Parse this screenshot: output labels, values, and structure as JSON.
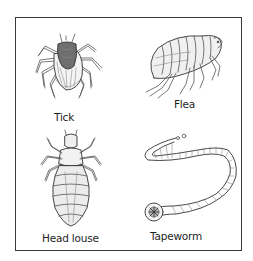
{
  "figure": {
    "panels": [
      {
        "id": "tick",
        "label": "Tick"
      },
      {
        "id": "flea",
        "label": "Flea"
      },
      {
        "id": "head-louse",
        "label": "Head louse"
      },
      {
        "id": "tapeworm",
        "label": "Tapeworm"
      }
    ]
  }
}
